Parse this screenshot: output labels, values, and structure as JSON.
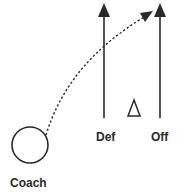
{
  "diagram": {
    "type": "coaching-position-diagram",
    "labels": {
      "coach": "Coach",
      "defense": "Def",
      "offense": "Off"
    },
    "elements": {
      "coach_marker": {
        "shape": "circle",
        "cx": 30,
        "cy": 145,
        "r": 18
      },
      "defense_path": {
        "shape": "solid-arrow",
        "direction": "up",
        "x": 104,
        "y_start": 118,
        "y_end": 3
      },
      "offense_path": {
        "shape": "solid-arrow",
        "direction": "up",
        "x": 160,
        "y_start": 118,
        "y_end": 3
      },
      "pass_path": {
        "shape": "dotted-curved-arrow",
        "from": [
          46,
          135
        ],
        "to": [
          152,
          12
        ]
      },
      "cone_marker": {
        "shape": "triangle",
        "cx": 134,
        "y_top": 100,
        "y_bottom": 116
      }
    },
    "colors": {
      "stroke": "#2a2a2a",
      "background": "#ffffff"
    }
  }
}
